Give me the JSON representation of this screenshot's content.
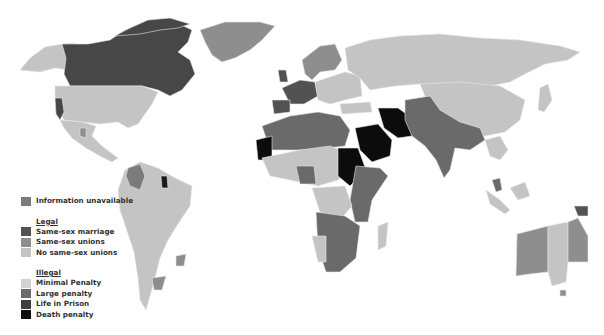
{
  "legend": {
    "info_unavailable": {
      "label": "Information unavailable",
      "color": "#7b7b7b"
    },
    "legal": {
      "heading": "Legal",
      "items": [
        {
          "label": "Same-sex marriage",
          "color": "#525252"
        },
        {
          "label": "Same-sex unions",
          "color": "#8e8e8e"
        },
        {
          "label": "No same-sex unions",
          "color": "#c4c4c4"
        }
      ]
    },
    "illegal": {
      "heading": "Illegal",
      "items": [
        {
          "label": "Minimal Penalty",
          "color": "#d2d2d2"
        },
        {
          "label": "Large penalty",
          "color": "#6a6a6a"
        },
        {
          "label": "Life in Prison",
          "color": "#3e3e3e"
        },
        {
          "label": "Death penalty",
          "color": "#0c0c0c"
        }
      ]
    }
  },
  "map": {
    "title": "World map of same-sex relationship legal status",
    "background": "#ffffff"
  }
}
